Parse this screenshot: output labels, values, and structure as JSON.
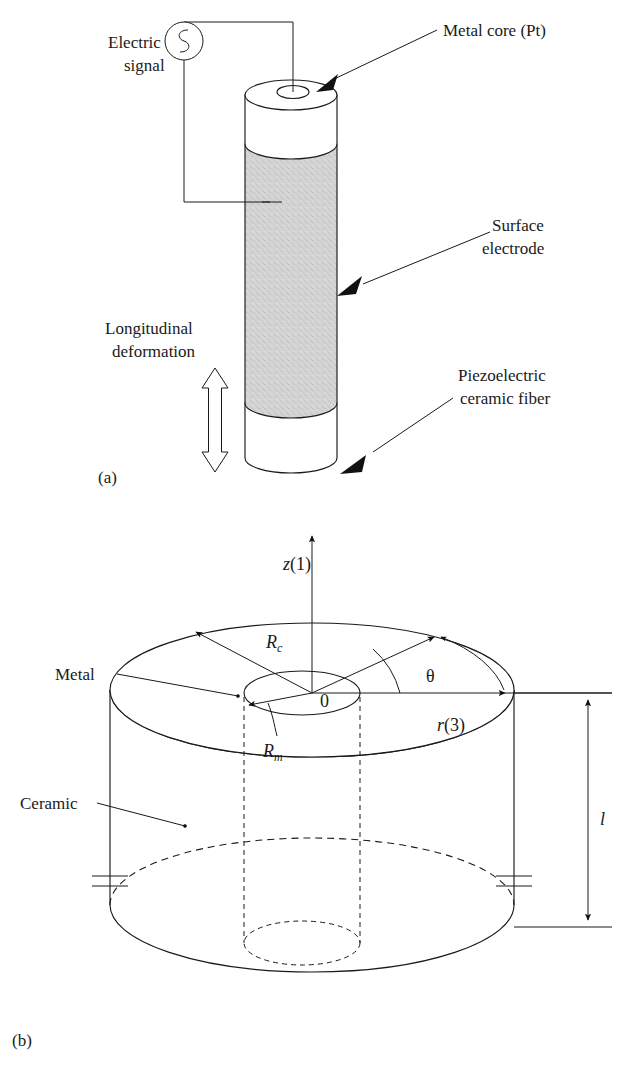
{
  "figure": {
    "panels": [
      {
        "id": "a",
        "tag": "(a)",
        "labels": {
          "electric_signal": "Electric\nsignal",
          "electric_signal_line1": "Electric",
          "electric_signal_line2": "signal",
          "metal_core": "Metal core (Pt)",
          "surface_electrode_line1": "Surface",
          "surface_electrode_line2": "electrode",
          "piezo_fiber_line1": "Piezoelectric",
          "piezo_fiber_line2": "ceramic fiber",
          "longitudinal_line1": "Longitudinal",
          "longitudinal_line2": "deformation"
        },
        "icons": {
          "source": "ac-source-icon",
          "deformation": "double-arrow-vertical-icon"
        },
        "colors": {
          "fiber_fill": "#d4d4d4",
          "band_fill": "#ffffff",
          "line": "#1a1a1a"
        }
      },
      {
        "id": "b",
        "tag": "(b)",
        "labels": {
          "axis_z": "z",
          "axis_z_index": "(1)",
          "axis_z_full": "z(1)",
          "axis_r": "r",
          "axis_r_index": "(3)",
          "axis_r_full": "r(3)",
          "theta": "θ",
          "origin": "0",
          "radius_ceramic": "R",
          "radius_ceramic_sub": "c",
          "radius_metal": "R",
          "radius_metal_sub": "m",
          "length": "l",
          "metal": "Metal",
          "ceramic": "Ceramic"
        },
        "icons": {
          "capacitor_left": "capacitor-icon",
          "capacitor_right": "capacitor-icon",
          "dimension": "dimension-arrow-icon"
        },
        "colors": {
          "line": "#1a1a1a",
          "hidden_line": "#1a1a1a"
        }
      }
    ]
  }
}
